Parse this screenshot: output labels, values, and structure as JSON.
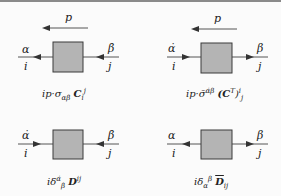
{
  "diagrams": [
    {
      "id": "top-left",
      "momentum": "p",
      "left_top": "α",
      "left_bottom": "i",
      "right_top": "β̇",
      "right_bottom": "j",
      "arrows": "left",
      "caption": {
        "pre": "ip·σ",
        "sub1": "αβ̇",
        "mid": "C",
        "sub2": "i",
        "sup2": "j"
      }
    },
    {
      "id": "top-right",
      "momentum": "p",
      "left_top": "α̇",
      "left_bottom": "i",
      "right_top": "β",
      "right_bottom": "j",
      "arrows": "right",
      "caption": {
        "pre": "ip·σ̄",
        "sup1": "α̇β",
        "mid": "(C",
        "sup_t": "T",
        "close": ")",
        "sup2": "i",
        "sub2": "j"
      }
    },
    {
      "id": "bottom-left",
      "left_top": "α̇",
      "left_bottom": "i",
      "right_top": "β̇",
      "right_bottom": "j",
      "arrows": "inward",
      "caption": {
        "pre": "iδ",
        "sup1": "α̇",
        "sub1": "β̇",
        "mid": "D",
        "sup2": "ij"
      }
    },
    {
      "id": "bottom-right",
      "left_top": "α",
      "left_bottom": "i",
      "right_top": "β",
      "right_bottom": "j",
      "arrows": "outward",
      "caption": {
        "pre": "iδ",
        "sub1": "α",
        "sup1": "β",
        "mid": "D",
        "sub2": "ij"
      }
    }
  ],
  "colors": {
    "box_fill": "#b4b4b4",
    "box_stroke": "#3a3a3a",
    "line": "#555555",
    "arrow": "#333333"
  }
}
